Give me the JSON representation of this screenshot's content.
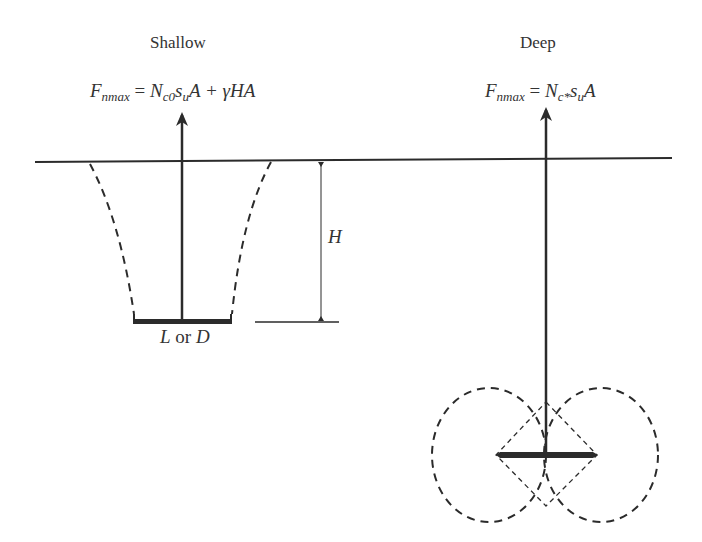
{
  "diagram": {
    "colors": {
      "ink": "#2b2b2b",
      "background": "#ffffff"
    },
    "shallow": {
      "title": "Shallow",
      "formula": {
        "lhs": "F",
        "lhs_sub": "nmax",
        "eq": " = ",
        "n": "N",
        "n_sub": "c0",
        "s": "s",
        "s_sub": "u",
        "rest": "A + γHA"
      },
      "width_label": {
        "l": "L",
        "or": " or ",
        "d": "D"
      },
      "depth_label": "H"
    },
    "deep": {
      "title": "Deep",
      "formula": {
        "lhs": "F",
        "lhs_sub": "nmax",
        "eq": " = ",
        "n": "N",
        "n_sub": "c*",
        "s": "s",
        "s_sub": "u",
        "rest": "A"
      }
    }
  }
}
